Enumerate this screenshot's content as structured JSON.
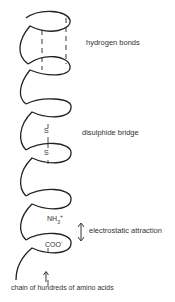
{
  "diagram": {
    "labels": {
      "hydrogen_bonds": "hydrogen bonds",
      "disulphide_bridge": "disulphide bridge",
      "electrostatic_attraction": "electrostatic attraction",
      "chain": "chain of hundreds of amino acids"
    },
    "atoms": {
      "sulfur_top": "S",
      "sulfur_bottom": "S",
      "amine": "NH",
      "amine_sub": "3",
      "amine_charge": "+",
      "carboxyl": "COO",
      "carboxyl_charge": "-"
    },
    "colors": {
      "line": "#222222",
      "text": "#333333"
    }
  }
}
